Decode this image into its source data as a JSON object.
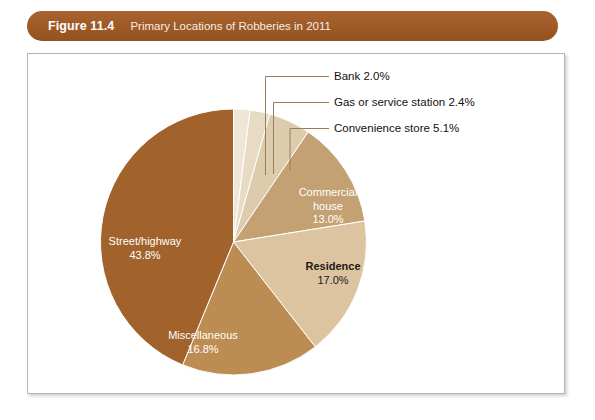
{
  "figure": {
    "number": "Figure 11.4",
    "title": "Primary Locations of Robberies in 2011"
  },
  "colors": {
    "header_bar": "#9d5a27",
    "header_text": "#ffffff",
    "card_background": "#ffffff",
    "card_border": "#b9b3ac",
    "leader_line": "#9a7d5c"
  },
  "chart_data": {
    "type": "pie",
    "title": "Primary Locations of Robberies in 2011",
    "xlabel": "",
    "ylabel": "",
    "units": "percent",
    "start_angle_deg": 0,
    "direction": "clockwise",
    "legend": "none",
    "grid": false,
    "categories": [
      "Bank",
      "Gas or service station",
      "Convenience store",
      "Commercial house",
      "Residence",
      "Miscellaneous",
      "Street/highway"
    ],
    "values": [
      2.0,
      2.4,
      5.1,
      13.0,
      17.0,
      16.8,
      43.8
    ],
    "slices": [
      {
        "name": "Bank",
        "value": 2.0,
        "value_label": "2.0%",
        "callout_text": "Bank 2.0%",
        "color": "#f0e6d6",
        "label_placement": "callout",
        "label_color": "#131110"
      },
      {
        "name": "Gas or service station",
        "value": 2.4,
        "value_label": "2.4%",
        "callout_text": "Gas or service station 2.4%",
        "color": "#e8dbc6",
        "label_placement": "callout",
        "label_color": "#131110"
      },
      {
        "name": "Convenience store",
        "value": 5.1,
        "value_label": "5.1%",
        "callout_text": "Convenience store 5.1%",
        "color": "#ddcbad",
        "label_placement": "callout",
        "label_color": "#131110"
      },
      {
        "name": "Commercial house",
        "value": 13.0,
        "value_label": "13.0%",
        "label_line1": "Commercial",
        "label_line2": "house",
        "color": "#c3a173",
        "label_placement": "inside",
        "label_color": "#ffffff"
      },
      {
        "name": "Residence",
        "value": 17.0,
        "value_label": "17.0%",
        "color": "#dcc4a0",
        "label_placement": "inside",
        "label_color": "#1c1a18"
      },
      {
        "name": "Miscellaneous",
        "value": 16.8,
        "value_label": "16.8%",
        "color": "#bc8c52",
        "label_placement": "inside",
        "label_color": "#ffffff"
      },
      {
        "name": "Street/highway",
        "value": 43.8,
        "value_label": "43.8%",
        "color": "#a2622c",
        "label_placement": "inside",
        "label_color": "#ffffff"
      }
    ]
  }
}
